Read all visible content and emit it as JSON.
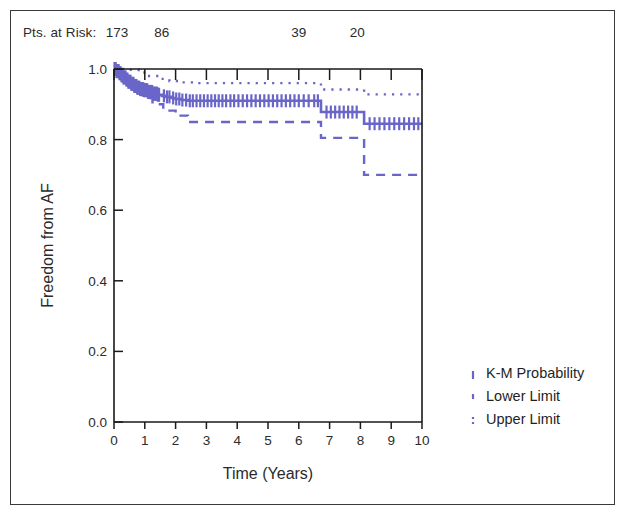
{
  "figure": {
    "title": "",
    "risk_label": "Pts. at Risk:"
  },
  "chart_data": {
    "type": "line",
    "title": "",
    "subtitle": "",
    "xlabel": "Time (Years)",
    "ylabel": "Freedom from AF",
    "xlim": [
      0,
      10
    ],
    "ylim": [
      0.0,
      1.0
    ],
    "xticks": [
      0,
      1,
      2,
      3,
      4,
      5,
      6,
      7,
      8,
      9,
      10
    ],
    "xtick_labels": [
      "0",
      "1",
      "2",
      "3",
      "4",
      "5",
      "6",
      "7",
      "8",
      "9",
      "10"
    ],
    "yticks": [
      0.0,
      0.2,
      0.4,
      0.6,
      0.8,
      1.0
    ],
    "ytick_labels": [
      "0.0",
      "0.2",
      "0.4",
      "0.6",
      "0.8",
      "1.0"
    ],
    "grid": false,
    "legend_position": "right",
    "accent_color": "#6a66c8",
    "axis_color": "#1a1a1a",
    "text_color": "#2b2b2b",
    "at_risk": {
      "label": "Pts. at Risk:",
      "times": [
        0,
        1.45,
        5.9,
        7.8
      ],
      "counts": [
        "173",
        "86",
        "39",
        "20"
      ]
    },
    "legend": [
      {
        "label": "K-M Probability",
        "style": "solid",
        "color": "#6a66c8"
      },
      {
        "label": "Lower Limit",
        "style": "dashed",
        "color": "#6a66c8"
      },
      {
        "label": "Upper Limit",
        "style": "dotted",
        "color": "#6a66c8"
      }
    ],
    "series": [
      {
        "name": "K-M Probability",
        "style": "solid",
        "color": "#6a66c8",
        "points": [
          [
            0.0,
            1.0
          ],
          [
            0.08,
            0.994
          ],
          [
            0.15,
            0.988
          ],
          [
            0.22,
            0.982
          ],
          [
            0.3,
            0.976
          ],
          [
            0.38,
            0.97
          ],
          [
            0.46,
            0.964
          ],
          [
            0.55,
            0.958
          ],
          [
            0.65,
            0.952
          ],
          [
            0.75,
            0.947
          ],
          [
            0.85,
            0.943
          ],
          [
            0.95,
            0.94
          ],
          [
            1.1,
            0.935
          ],
          [
            1.25,
            0.93
          ],
          [
            1.4,
            0.927
          ],
          [
            1.55,
            0.924
          ],
          [
            1.7,
            0.921
          ],
          [
            1.85,
            0.918
          ],
          [
            2.0,
            0.915
          ],
          [
            2.2,
            0.912
          ],
          [
            2.4,
            0.91
          ],
          [
            6.7,
            0.91
          ],
          [
            6.72,
            0.878
          ],
          [
            8.1,
            0.878
          ],
          [
            8.12,
            0.845
          ],
          [
            10.0,
            0.845
          ]
        ]
      },
      {
        "name": "Lower Limit",
        "style": "dashed",
        "color": "#6a66c8",
        "points": [
          [
            0.0,
            1.0
          ],
          [
            0.2,
            0.975
          ],
          [
            0.45,
            0.955
          ],
          [
            0.7,
            0.935
          ],
          [
            0.95,
            0.918
          ],
          [
            1.25,
            0.9
          ],
          [
            1.6,
            0.882
          ],
          [
            2.0,
            0.868
          ],
          [
            2.4,
            0.85
          ],
          [
            6.7,
            0.85
          ],
          [
            6.72,
            0.805
          ],
          [
            8.1,
            0.805
          ],
          [
            8.12,
            0.7
          ],
          [
            10.0,
            0.7
          ]
        ]
      },
      {
        "name": "Upper Limit",
        "style": "dotted",
        "color": "#6a66c8",
        "points": [
          [
            0.0,
            1.0
          ],
          [
            0.2,
            1.0
          ],
          [
            0.5,
            0.998
          ],
          [
            0.8,
            0.99
          ],
          [
            1.1,
            0.98
          ],
          [
            1.45,
            0.972
          ],
          [
            1.8,
            0.966
          ],
          [
            2.2,
            0.962
          ],
          [
            2.6,
            0.96
          ],
          [
            6.7,
            0.96
          ],
          [
            6.72,
            0.942
          ],
          [
            8.1,
            0.942
          ],
          [
            8.12,
            0.928
          ],
          [
            10.0,
            0.928
          ]
        ]
      }
    ],
    "censor_times": [
      1.62,
      1.72,
      1.8,
      1.92,
      2.02,
      2.12,
      2.22,
      2.34,
      2.46,
      2.56,
      2.68,
      2.8,
      2.92,
      3.04,
      3.16,
      3.28,
      3.4,
      3.52,
      3.64,
      3.78,
      3.9,
      4.04,
      4.18,
      4.32,
      4.46,
      4.6,
      4.74,
      4.88,
      5.02,
      5.16,
      5.3,
      5.44,
      5.58,
      5.72,
      5.86,
      6.0,
      6.16,
      6.32,
      6.5,
      6.62,
      6.9,
      7.04,
      7.18,
      7.32,
      7.46,
      7.6,
      7.74,
      7.88,
      8.3,
      8.46,
      8.62,
      8.78,
      8.94,
      9.1,
      9.26,
      9.42,
      9.58,
      9.74,
      9.88
    ]
  }
}
